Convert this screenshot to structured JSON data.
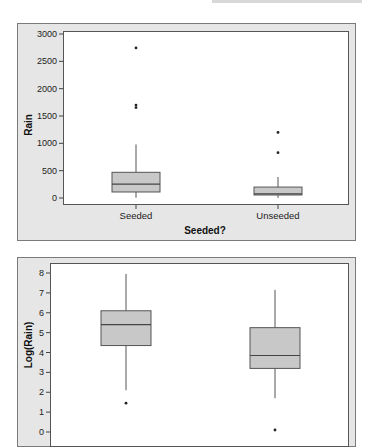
{
  "chart_data": [
    {
      "type": "box",
      "title": "",
      "xlabel": "Seeded?",
      "ylabel": "Rain",
      "categories": [
        "Seeded",
        "Unseeded"
      ],
      "yticks": [
        0,
        500,
        1000,
        1500,
        2000,
        2500,
        3000
      ],
      "ylim": [
        -100,
        3000
      ],
      "grid": false,
      "series": [
        {
          "name": "Seeded",
          "whisker_low": 5,
          "q1": 110,
          "median": 255,
          "q3": 470,
          "whisker_high": 980,
          "outliers": [
            1655,
            1700,
            2745
          ]
        },
        {
          "name": "Unseeded",
          "whisker_low": 1,
          "q1": 55,
          "median": 75,
          "q3": 200,
          "whisker_high": 385,
          "outliers": [
            830,
            1200
          ]
        }
      ]
    },
    {
      "type": "box",
      "title": "",
      "xlabel": "",
      "ylabel": "Log(Rain)",
      "categories": [
        "Seeded",
        "Unseeded"
      ],
      "yticks": [
        0,
        1,
        2,
        3,
        4,
        5,
        6,
        7,
        8
      ],
      "ylim": [
        -0.1,
        8.1
      ],
      "grid": false,
      "series": [
        {
          "name": "Seeded",
          "whisker_low": 2.1,
          "q1": 4.35,
          "median": 5.4,
          "q3": 6.1,
          "whisker_high": 7.95,
          "outliers": [
            1.45
          ]
        },
        {
          "name": "Unseeded",
          "whisker_low": 1.7,
          "q1": 3.2,
          "median": 3.85,
          "q3": 5.25,
          "whisker_high": 7.15,
          "outliers": [
            0.1
          ]
        }
      ]
    }
  ],
  "top_chart": {
    "ylabel": "Rain",
    "xlabel": "Seeded?",
    "ytick_labels": [
      "0",
      "500",
      "1000",
      "1500",
      "2000",
      "2500",
      "3000"
    ],
    "categories": [
      "Seeded",
      "Unseeded"
    ]
  },
  "bottom_chart": {
    "ylabel": "Log(Rain)",
    "ytick_labels": [
      "0",
      "1",
      "2",
      "3",
      "4",
      "5",
      "6",
      "7",
      "8"
    ]
  },
  "colors": {
    "panel_bg": "#e6e6e6",
    "plot_bg": "#ffffff",
    "box_fill": "#c8c8c8",
    "box_stroke": "#555555",
    "outlier": "#222222"
  }
}
